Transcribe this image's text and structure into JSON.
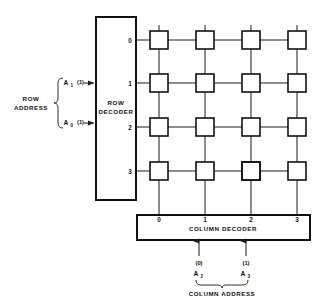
{
  "diagram": {
    "row_address": {
      "caption_line1": "ROW",
      "caption_line2": "ADDRESS",
      "inputs": [
        {
          "name": "A",
          "subscript": "1",
          "value": "(1)"
        },
        {
          "name": "A",
          "subscript": "0",
          "value": "(1)"
        }
      ]
    },
    "row_decoder": {
      "label_line1": "ROW",
      "label_line2": "DECODER",
      "outputs": [
        "0",
        "1",
        "2",
        "3"
      ]
    },
    "column_decoder": {
      "label": "COLUMN DECODER",
      "outputs": [
        "0",
        "1",
        "2",
        "3"
      ]
    },
    "column_address": {
      "caption": "COLUMN ADDRESS",
      "inputs": [
        {
          "name": "A",
          "subscript": "2",
          "value": "(0)"
        },
        {
          "name": "A",
          "subscript": "3",
          "value": "(1)"
        }
      ]
    },
    "cell_array": {
      "rows": 4,
      "columns": 4,
      "selected_cell": {
        "row": 3,
        "column": 2
      }
    },
    "colors": {
      "line": "#1a1a1a",
      "box_stroke": "#111111",
      "box_fill": "#ffffff",
      "selected_cell_fill": "#9a9a9a",
      "background": "#ffffff"
    }
  }
}
